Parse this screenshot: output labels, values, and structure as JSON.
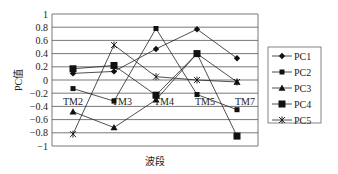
{
  "chart_data": {
    "type": "line",
    "title": "",
    "xlabel": "波段",
    "ylabel": "PC值",
    "ylim": [
      -1,
      1
    ],
    "yticks": [
      1,
      0.8,
      0.6,
      0.4,
      0.2,
      0,
      -0.2,
      -0.4,
      -0.6,
      -0.8,
      -1
    ],
    "ytick_labels": [
      "1",
      "0.8",
      "0.6",
      "0.4",
      "0.2",
      "0",
      "−0.2",
      "−0.4",
      "−0.6",
      "−0.8",
      "−1"
    ],
    "categories": [
      "TM2",
      "TM3",
      "TM4",
      "TM5",
      "TM7"
    ],
    "grid": true,
    "legend_position": "right",
    "series": [
      {
        "name": "PC1",
        "marker": "diamond",
        "values": [
          0.1,
          0.13,
          0.47,
          0.77,
          0.33
        ]
      },
      {
        "name": "PC2",
        "marker": "small-square",
        "values": [
          -0.13,
          -0.32,
          0.78,
          -0.22,
          -0.45
        ]
      },
      {
        "name": "PC3",
        "marker": "triangle",
        "values": [
          -0.48,
          -0.72,
          -0.3,
          0.4,
          -0.03
        ]
      },
      {
        "name": "PC4",
        "marker": "large-square",
        "values": [
          0.17,
          0.22,
          -0.23,
          0.4,
          -0.85
        ]
      },
      {
        "name": "PC5",
        "marker": "asterisk",
        "values": [
          -0.82,
          0.53,
          0.05,
          0.0,
          -0.03
        ]
      }
    ]
  }
}
